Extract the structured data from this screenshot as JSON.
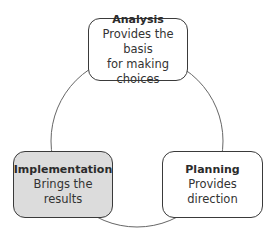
{
  "diagram": {
    "type": "cycle",
    "nodes": [
      {
        "id": "analysis",
        "title": "Analysis",
        "description_lines": [
          "Provides the basis",
          "for making choices"
        ],
        "highlighted": false
      },
      {
        "id": "planning",
        "title": "Planning",
        "description_lines": [
          "Provides direction"
        ],
        "highlighted": false
      },
      {
        "id": "implementation",
        "title": "Implementation",
        "description_lines": [
          "Brings the results"
        ],
        "highlighted": true
      }
    ],
    "colors": {
      "border": "#3a3a3a",
      "highlight_fill": "#dcdcdc",
      "connector": "#666666"
    }
  }
}
